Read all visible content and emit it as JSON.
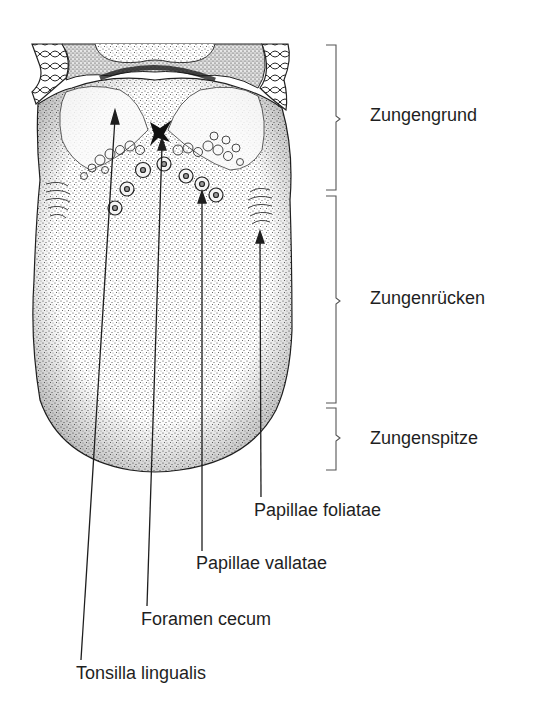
{
  "figure": {
    "regions": [
      {
        "id": "grund",
        "label": "Zungengrund",
        "bracket_top": 45,
        "bracket_bottom": 190,
        "label_y": 104
      },
      {
        "id": "ruecken",
        "label": "Zungenrücken",
        "bracket_top": 196,
        "bracket_bottom": 403,
        "label_y": 287
      },
      {
        "id": "spitze",
        "label": "Zungenspitze",
        "bracket_top": 408,
        "bracket_bottom": 470,
        "label_y": 428
      }
    ],
    "structures": [
      {
        "id": "foliatae",
        "label": "Papillae foliatae",
        "tip": [
          260,
          233
        ],
        "end": [
          261,
          497
        ],
        "label_x": 254,
        "label_y": 501
      },
      {
        "id": "vallatae",
        "label": "Papillae vallatae",
        "tip": [
          202,
          193
        ],
        "end": [
          202,
          551
        ],
        "label_x": 196,
        "label_y": 554
      },
      {
        "id": "foramen",
        "label": "Foramen cecum",
        "tip": [
          162,
          140
        ],
        "end": [
          147,
          606
        ],
        "label_x": 141,
        "label_y": 610
      },
      {
        "id": "tonsilla",
        "label": "Tonsilla lingualis",
        "tip": [
          115,
          112
        ],
        "end": [
          81,
          660
        ],
        "label_x": 76,
        "label_y": 664
      }
    ]
  },
  "colors": {
    "ink": "#1e1e1e",
    "bracket": "#555555",
    "background": "#ffffff"
  }
}
